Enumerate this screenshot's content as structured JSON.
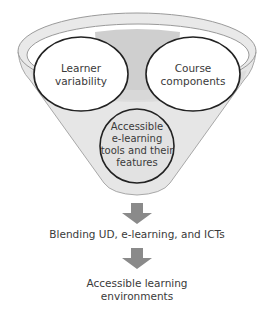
{
  "diagram": {
    "type": "funnel",
    "funnel": {
      "inputs": [
        {
          "id": "learner-variability",
          "lines": [
            "Learner",
            "variability"
          ]
        },
        {
          "id": "course-components",
          "lines": [
            "Course",
            "components"
          ]
        },
        {
          "id": "accessible-tools",
          "lines": [
            "Accessible",
            "e-learning",
            "tools and their",
            "features"
          ]
        }
      ]
    },
    "steps": [
      {
        "id": "blending",
        "lines": [
          "Blending UD, e-learning, and ICTs"
        ]
      },
      {
        "id": "outcome",
        "lines": [
          "Accessible learning",
          "environments"
        ]
      }
    ],
    "arrows": [
      {
        "from": "funnel",
        "to": "blending",
        "icon": "down-arrow-icon"
      },
      {
        "from": "blending",
        "to": "outcome",
        "icon": "down-arrow-icon"
      }
    ],
    "colors": {
      "funnel_fill": "#e6e6e6",
      "funnel_inner": "#c9c9c9",
      "funnel_stroke": "#9a9a9a",
      "circle_stroke": "#222222",
      "circle_fill": "#ffffff",
      "bottom_circle_fill": "#e2e2e2",
      "arrow_fill": "#8a8a8a",
      "text": "#3a3a3a"
    }
  }
}
